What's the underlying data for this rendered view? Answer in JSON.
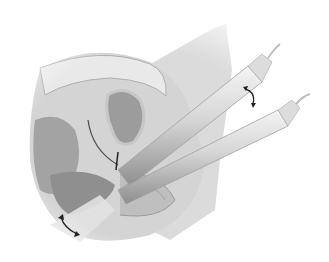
{
  "figure": {
    "type": "medical-illustration",
    "style": "grayscale anatomical drawing",
    "elements": [
      {
        "name": "pelvic-anatomy-cross-section",
        "description": "sagittal cut-away of pelvic organs"
      },
      {
        "name": "upper-probe",
        "description": "cylindrical surgical instrument entering from upper right"
      },
      {
        "name": "lower-probe",
        "description": "cylindrical surgical instrument entering from right, below upper probe"
      },
      {
        "name": "rotation-arrow-upper",
        "description": "curved double-headed arrow between the two probes"
      },
      {
        "name": "rotation-arrow-lower",
        "description": "curved double-headed arrow at lower left"
      }
    ],
    "colors": {
      "background": "#ffffff",
      "tissue_dark": "#8e8e8e",
      "tissue_mid": "#b4b4b4",
      "tissue_light": "#d8d8d8",
      "probe_light": "#e6e6e6",
      "probe_shade": "#9a9a9a",
      "arrow": "#222222"
    }
  }
}
